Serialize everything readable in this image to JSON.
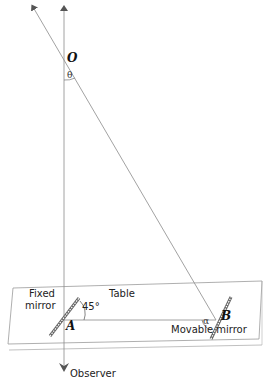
{
  "diagram": {
    "labels": {
      "point_o": "O",
      "angle_theta": "θ",
      "fixed_mirror_line1": "Fixed",
      "fixed_mirror_line2": "mirror",
      "table": "Table",
      "angle_45": "45°",
      "point_a": "A",
      "angle_alpha": "α",
      "point_b": "B",
      "movable_mirror": "Movable mirror",
      "observer": "Observer"
    },
    "colors": {
      "line": "#8a8a8a",
      "dark_line": "#555555",
      "text": "#222222"
    }
  }
}
